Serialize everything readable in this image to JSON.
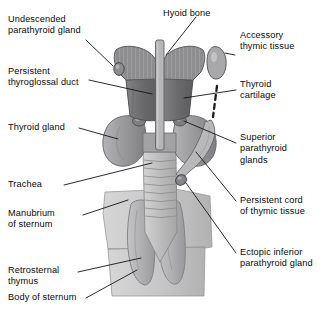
{
  "figure": {
    "background_color": "#ffffff",
    "ink_color": "#111111",
    "palette": {
      "hyoid_hatch": "#8f8f8f",
      "thyroid_cartilage": "#6f6f71",
      "thyroid_gland": "#9a9a9c",
      "trachea": "#bdbdbd",
      "sternum": "#c9c9c9",
      "thymus": "#b0b0b2",
      "accessory_thymic_tissue": "#a5a5a7",
      "parathyroid": "#8a8a8c",
      "leader_line": "#1a1a1a"
    }
  },
  "labels": {
    "undescended_parathyroid_gland": "Undescended\nparathyroid gland",
    "persistent_thyroglossal_duct": "Persistent\nthyroglossal duct",
    "thyroid_gland": "Thyroid gland",
    "trachea": "Trachea",
    "manubrium_of_sternum": "Manubrium\nof sternum",
    "retrosternal_thymus": "Retrosternal\nthymus",
    "body_of_sternum": "Body of sternum",
    "hyoid_bone": "Hyoid bone",
    "accessory_thymic_tissue": "Accessory\nthymic tissue",
    "thyroid_cartilage": "Thyroid\ncartilage",
    "superior_parathyroid_glands": "Superior\nparathyroid\nglands",
    "persistent_cord_of_thymic_tissue": "Persistent cord\nof thymic tissue",
    "ectopic_inferior_parathyroid_gland": "Ectopic inferior\nparathyroid gland"
  },
  "structures": [
    {
      "name": "hyoid-bone",
      "style": "cross-hatched butterfly",
      "position": "top-center"
    },
    {
      "name": "thyroid-cartilage",
      "style": "dark gray shield",
      "position": "upper-center"
    },
    {
      "name": "thyroid-gland",
      "style": "mid gray butterfly lobes",
      "position": "center"
    },
    {
      "name": "trachea",
      "style": "light gray ringed tube",
      "position": "center-lower"
    },
    {
      "name": "manubrium-of-sternum",
      "style": "light gray plate",
      "position": "lower-center"
    },
    {
      "name": "body-of-sternum",
      "style": "light gray plate",
      "position": "bottom-center"
    },
    {
      "name": "retrosternal-thymus",
      "style": "two pale lobes",
      "position": "bottom-center"
    },
    {
      "name": "accessory-thymic-tissue",
      "style": "isolated oval",
      "position": "right-upper"
    },
    {
      "name": "persistent-cord-of-thymic-tissue",
      "style": "dashed cord plus slender band",
      "position": "right-center"
    },
    {
      "name": "undescended-parathyroid-gland",
      "style": "small oval",
      "position": "left of hyoid"
    },
    {
      "name": "superior-parathyroid-glands",
      "style": "two small nodules on thyroid lobes",
      "position": "center"
    },
    {
      "name": "ectopic-inferior-parathyroid-gland",
      "style": "small nodule low on cord",
      "position": "right-lower"
    }
  ]
}
